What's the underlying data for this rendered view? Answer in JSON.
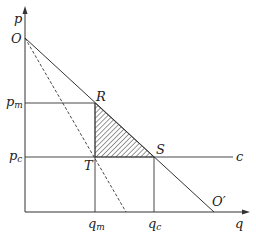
{
  "diagram": {
    "axes": {
      "y_label": "p",
      "x_label": "q"
    },
    "points": {
      "O": "O",
      "O_prime": "O′",
      "R": "R",
      "S": "S",
      "T": "T"
    },
    "price_labels": {
      "pm_base": "p",
      "pm_sub": "m",
      "pc_base": "p",
      "pc_sub": "c"
    },
    "quantity_labels": {
      "qm_base": "q",
      "qm_sub": "m",
      "qc_base": "q",
      "qc_sub": "c"
    },
    "cost_line_label": "c",
    "elements": [
      "demand line O to O′ (solid)",
      "marginal revenue line from O (dashed)",
      "horizontal cost line c at p_c",
      "shaded deadweight-loss triangle R-T-S"
    ],
    "colors": {
      "line": "#333333",
      "hatch": "#333333",
      "background": "#ffffff"
    }
  }
}
